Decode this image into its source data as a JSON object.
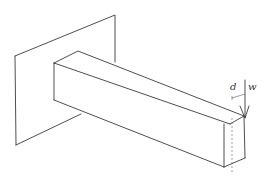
{
  "diagram": {
    "labels": {
      "d": "d",
      "w": "w"
    },
    "elements": [
      "wall-plane",
      "beam",
      "load-arrow",
      "dimension-d",
      "centerline"
    ]
  }
}
